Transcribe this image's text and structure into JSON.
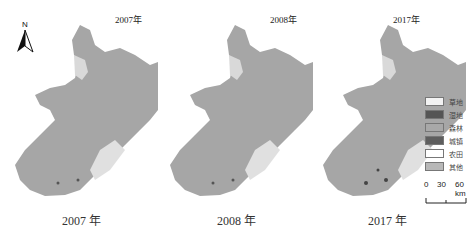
{
  "figure": {
    "panels": [
      {
        "top_title": "2007年",
        "bottom_title": "2007 年"
      },
      {
        "top_title": "2008年",
        "bottom_title": "2008 年"
      },
      {
        "top_title": "2017年",
        "bottom_title": "2017 年"
      }
    ],
    "north_arrow": {
      "label": "N"
    },
    "legend": {
      "items": [
        {
          "label": "草地",
          "color": "#f2f2f2"
        },
        {
          "label": "湿地",
          "color": "#555555"
        },
        {
          "label": "森林",
          "color": "#a8a8a8"
        },
        {
          "label": "城镇",
          "color": "#5e5e5e"
        },
        {
          "label": "农田",
          "color": "#ffffff"
        },
        {
          "label": "其他",
          "color": "#b8b8b8"
        }
      ]
    },
    "scale_bar": {
      "ticks": [
        "0",
        "30",
        "60 km"
      ]
    },
    "colors": {
      "land": "#a6a6a6",
      "land_light": "#d9d9d9"
    }
  }
}
